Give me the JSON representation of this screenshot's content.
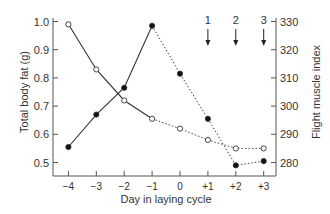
{
  "chart_data": {
    "type": "line",
    "title": "",
    "xlabel": "Day in laying cycle",
    "ylabel": "Total body fat (g)",
    "ylabel_right": "Flight muscle index",
    "categories": [
      "-4",
      "-3",
      "-2",
      "-1",
      "0",
      "+1",
      "+2",
      "+3"
    ],
    "x": [
      -4,
      -3,
      -2,
      -1,
      0,
      1,
      2,
      3
    ],
    "ylim": [
      0.45,
      1.0
    ],
    "ylim_right": [
      275,
      330
    ],
    "yticks": [
      "0.5",
      "0.6",
      "0.7",
      "0.8",
      "0.9",
      "1.0"
    ],
    "yticks_right": [
      "280",
      "290",
      "300",
      "310",
      "320",
      "330"
    ],
    "series": [
      {
        "name": "Total body fat",
        "axis": "left",
        "marker": "open-circle",
        "values": [
          0.99,
          0.83,
          0.72,
          0.655,
          0.62,
          0.58,
          0.55,
          0.55
        ],
        "solid_until_index": 3
      },
      {
        "name": "Flight muscle index",
        "axis": "right",
        "marker": "filled-circle",
        "values": [
          285.5,
          297,
          306.5,
          328.5,
          311.5,
          295.5,
          279,
          280.5
        ],
        "solid_until_index": 3
      }
    ],
    "annotations": [
      {
        "label": "1",
        "x": 1,
        "type": "down-arrow"
      },
      {
        "label": "2",
        "x": 2,
        "type": "down-arrow"
      },
      {
        "label": "3",
        "x": 3,
        "type": "down-arrow"
      }
    ],
    "grid": false,
    "legend": "none"
  }
}
